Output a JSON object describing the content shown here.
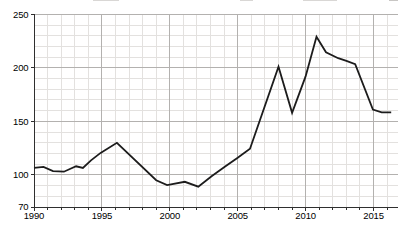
{
  "chart_data": {
    "type": "line",
    "title": "",
    "xlabel": "",
    "ylabel": "",
    "grid": true,
    "legend": "none",
    "x_axis": {
      "labeled_ticks": [
        "1990",
        "1995",
        "2000",
        "2005",
        "2010",
        "2015"
      ],
      "labeled_tick_values": [
        1990,
        1995,
        2000,
        2005,
        2010,
        2015
      ],
      "minor_tick_step_years": 1,
      "range": [
        1990,
        2016.8
      ]
    },
    "y_axis": {
      "labeled_ticks": [
        "250",
        "200",
        "150",
        "100",
        "70"
      ],
      "labeled_tick_values": [
        250,
        200,
        150,
        100,
        70
      ],
      "gridline_values": [
        250,
        200,
        150,
        100
      ],
      "minor_gridline_step": 10,
      "range": [
        70,
        250
      ]
    },
    "series": [
      {
        "name": "series-1",
        "points": [
          [
            1990.0,
            106.5
          ],
          [
            1990.7,
            107.5
          ],
          [
            1991.4,
            103.5
          ],
          [
            1992.2,
            103.0
          ],
          [
            1993.1,
            108.0
          ],
          [
            1993.6,
            106.5
          ],
          [
            1994.2,
            113.5
          ],
          [
            1994.9,
            120.5
          ],
          [
            1996.1,
            130.0
          ],
          [
            1999.0,
            95.0
          ],
          [
            1999.8,
            90.5
          ],
          [
            2001.1,
            93.5
          ],
          [
            2002.1,
            89.0
          ],
          [
            2003.1,
            99.0
          ],
          [
            2004.1,
            108.0
          ],
          [
            2005.0,
            116.0
          ],
          [
            2005.9,
            124.5
          ],
          [
            2008.0,
            201.0
          ],
          [
            2009.0,
            158.0
          ],
          [
            2010.0,
            192.0
          ],
          [
            2010.8,
            229.0
          ],
          [
            2011.5,
            214.5
          ],
          [
            2012.4,
            209.0
          ],
          [
            2013.0,
            206.5
          ],
          [
            2013.65,
            203.5
          ],
          [
            2014.95,
            161.0
          ],
          [
            2015.6,
            158.5
          ],
          [
            2016.3,
            158.5
          ]
        ]
      }
    ],
    "yearly_estimates": {
      "categories": [
        1990,
        1991,
        1992,
        1993,
        1994,
        1995,
        1996,
        1997,
        1998,
        1999,
        2000,
        2001,
        2002,
        2003,
        2004,
        2005,
        2006,
        2007,
        2008,
        2009,
        2010,
        2011,
        2012,
        2013,
        2014,
        2015,
        2016
      ],
      "values": [
        106,
        104,
        103,
        108,
        112,
        121,
        130,
        122,
        109,
        95,
        91,
        93,
        89,
        98,
        107,
        116,
        127,
        163,
        201,
        158,
        192,
        225,
        210,
        206,
        192,
        161,
        158
      ]
    }
  },
  "colors": {
    "background": "#ffffff",
    "line": "#1c1c1c",
    "grid_minor": "#e3e1df",
    "grid_major": "#b3b1af",
    "axis": "#2f2f2f",
    "tick_label": "#000000"
  }
}
